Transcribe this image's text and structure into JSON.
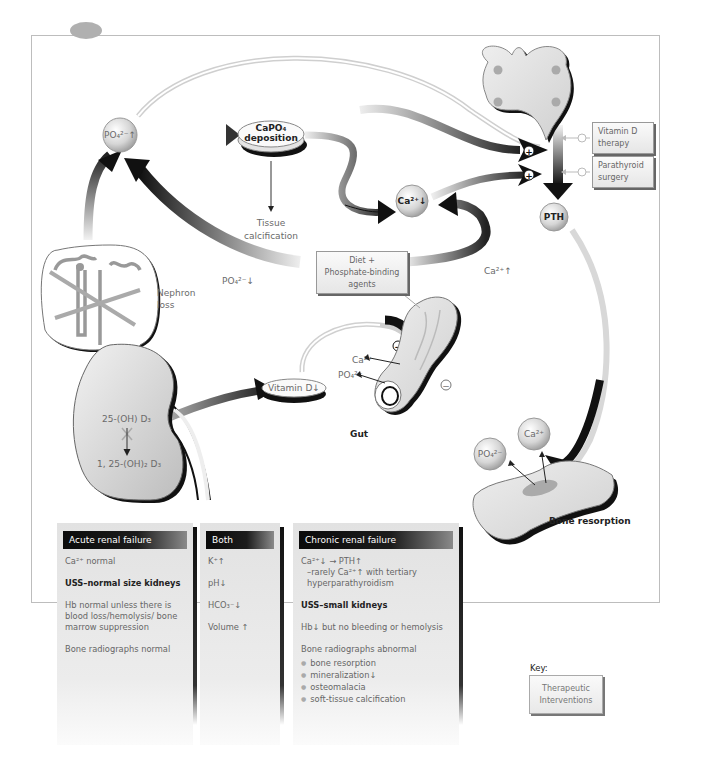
{
  "diagram": {
    "nodes": {
      "po4_up": "PO₄²⁻↑",
      "capo4_deposition_line1": "CaPO₄",
      "capo4_deposition_line2": "deposition",
      "tissue_calcification_line1": "Tissue",
      "tissue_calcification_line2": "calcification",
      "ca_down": "Ca²⁺↓",
      "pth": "PTH",
      "nephron_loss_line1": "Nephron",
      "nephron_loss_line2": "loss",
      "po4_down_label": "PO₄²⁻↓",
      "ca_up_label": "Ca²⁺↑",
      "vitamin_d_down": "Vitamin D↓",
      "kidney_precursor": "25-(OH) D₃",
      "kidney_product": "1, 25-(OH)₂ D₃",
      "gut_ca": "Ca²⁺",
      "gut_po4": "PO₄²⁻",
      "gut": "Gut",
      "bone_po4": "PO₄²⁻",
      "bone_ca": "Ca²⁺",
      "bone_resorption": "Bone resorption",
      "stimulate_symbol": "+",
      "inhibit_symbol": "−"
    },
    "interventions": {
      "vitamin_d_therapy": "Vitamin D therapy",
      "parathyroid_surgery": "Parathyroid surgery",
      "diet_line1": "Diet +",
      "diet_line2": "Phosphate-binding",
      "diet_line3": "agents"
    },
    "icons": [
      "parathyroid-gland-icon",
      "kidney-icon",
      "nephron-icon",
      "gut-icon",
      "bone-icon"
    ]
  },
  "table": {
    "acute": {
      "header": "Acute renal failure",
      "items": [
        "Ca²⁺ normal",
        "USS–normal size kidneys",
        "Hb normal unless there is blood loss/hemolysis/ bone marrow suppression",
        "Bone radiographs normal"
      ]
    },
    "both": {
      "header": "Both",
      "items": [
        "K⁺↑",
        "pH↓",
        "HCO₃⁻↓",
        "Volume ↑"
      ]
    },
    "chronic": {
      "header": "Chronic renal failure",
      "items": [
        "Ca²⁺↓ → PTH↑",
        "–rarely Ca²⁺↑ with tertiary hyperparathyroidism",
        "USS–small kidneys",
        "Hb↓ but no bleeding or hemolysis",
        "Bone radiographs abnormal"
      ],
      "bullets": [
        "bone resorption",
        "mineralization↓",
        "osteomalacia",
        "soft-tissue calcification"
      ]
    }
  },
  "key": {
    "label": "Key:",
    "box_line1": "Therapeutic",
    "box_line2": "Interventions"
  }
}
